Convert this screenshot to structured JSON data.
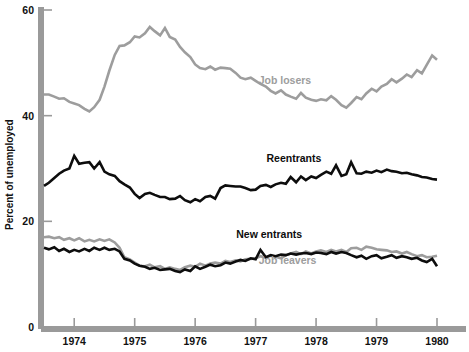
{
  "chart_data": {
    "type": "line",
    "title": "",
    "xlabel": "",
    "ylabel": "Percent of unemployed",
    "ylim": [
      0,
      60
    ],
    "xlim": [
      1973.5,
      1980.0
    ],
    "grid": false,
    "legend_position": "inline-annotations",
    "y_ticks": [
      0,
      20,
      40,
      60
    ],
    "y_tick_labels": [
      "0",
      "20",
      "40",
      "60"
    ],
    "x_ticks": [
      1974,
      1975,
      1976,
      1977,
      1978,
      1979,
      1980
    ],
    "x_tick_labels": [
      "1974",
      "1975",
      "1976",
      "1977",
      "1978",
      "1979",
      "1980"
    ],
    "colors": {
      "dark": "#0d0d0d",
      "gray": "#9d9d9d",
      "axis": "#9a9a9a"
    },
    "series": [
      {
        "name": "Job losers",
        "color": "#9d9d9d",
        "label_x": 1977.05,
        "label_y": 46.0,
        "x": [
          1973.5,
          1973.58,
          1973.67,
          1973.75,
          1973.83,
          1973.92,
          1974.0,
          1974.08,
          1974.17,
          1974.25,
          1974.33,
          1974.42,
          1974.5,
          1974.58,
          1974.67,
          1974.75,
          1974.83,
          1974.92,
          1975.0,
          1975.08,
          1975.17,
          1975.25,
          1975.33,
          1975.42,
          1975.5,
          1975.58,
          1975.67,
          1975.75,
          1975.83,
          1975.92,
          1976.0,
          1976.08,
          1976.17,
          1976.25,
          1976.33,
          1976.42,
          1976.5,
          1976.58,
          1976.67,
          1976.75,
          1976.83,
          1976.92,
          1977.0,
          1977.08,
          1977.17,
          1977.25,
          1977.33,
          1977.42,
          1977.5,
          1977.58,
          1977.67,
          1977.75,
          1977.83,
          1977.92,
          1978.0,
          1978.08,
          1978.17,
          1978.25,
          1978.33,
          1978.42,
          1978.5,
          1978.58,
          1978.67,
          1978.75,
          1978.83,
          1978.92,
          1979.0,
          1979.08,
          1979.17,
          1979.25,
          1979.33,
          1979.42,
          1979.5,
          1979.58,
          1979.67,
          1979.75,
          1979.83,
          1979.92,
          1980.0
        ],
        "values": [
          44.0,
          44.0,
          43.6,
          43.2,
          43.3,
          42.6,
          42.3,
          42.0,
          41.3,
          40.8,
          41.6,
          43.0,
          45.5,
          48.5,
          51.5,
          53.2,
          53.3,
          53.9,
          55.0,
          54.8,
          55.6,
          56.8,
          56.0,
          55.2,
          56.6,
          54.9,
          54.4,
          53.0,
          52.0,
          51.1,
          49.7,
          49.0,
          48.8,
          49.3,
          48.7,
          49.1,
          49.0,
          48.9,
          48.1,
          47.2,
          46.9,
          47.2,
          46.6,
          46.0,
          45.5,
          44.7,
          44.2,
          44.8,
          44.0,
          43.6,
          43.2,
          44.3,
          43.4,
          43.0,
          42.8,
          43.1,
          42.9,
          43.7,
          43.0,
          42.0,
          41.5,
          42.4,
          43.5,
          43.1,
          44.2,
          45.1,
          44.6,
          45.5,
          46.0,
          46.9,
          46.3,
          47.0,
          47.8,
          47.3,
          48.6,
          48.0,
          49.6,
          51.4,
          50.6
        ]
      },
      {
        "name": "Reentrants",
        "color": "#0d0d0d",
        "label_x": 1977.18,
        "label_y": 31.3,
        "x": [
          1973.5,
          1973.58,
          1973.67,
          1973.75,
          1973.83,
          1973.92,
          1974.0,
          1974.08,
          1974.17,
          1974.25,
          1974.33,
          1974.42,
          1974.5,
          1974.58,
          1974.67,
          1974.75,
          1974.83,
          1974.92,
          1975.0,
          1975.08,
          1975.17,
          1975.25,
          1975.33,
          1975.42,
          1975.5,
          1975.58,
          1975.67,
          1975.75,
          1975.83,
          1975.92,
          1976.0,
          1976.08,
          1976.17,
          1976.25,
          1976.33,
          1976.42,
          1976.5,
          1976.58,
          1976.67,
          1976.75,
          1976.83,
          1976.92,
          1977.0,
          1977.08,
          1977.17,
          1977.25,
          1977.33,
          1977.42,
          1977.5,
          1977.58,
          1977.67,
          1977.75,
          1977.83,
          1977.92,
          1978.0,
          1978.08,
          1978.17,
          1978.25,
          1978.33,
          1978.42,
          1978.5,
          1978.58,
          1978.67,
          1978.75,
          1978.83,
          1978.92,
          1979.0,
          1979.08,
          1979.17,
          1979.25,
          1979.33,
          1979.42,
          1979.5,
          1979.58,
          1979.67,
          1979.75,
          1979.83,
          1979.92,
          1980.0
        ],
        "values": [
          26.7,
          27.3,
          28.2,
          29.0,
          29.6,
          30.0,
          32.4,
          30.9,
          31.1,
          31.2,
          30.0,
          31.2,
          29.4,
          28.9,
          28.6,
          27.6,
          27.0,
          26.4,
          25.2,
          24.4,
          25.2,
          25.4,
          25.0,
          24.6,
          24.6,
          24.2,
          24.3,
          24.8,
          24.0,
          23.6,
          24.2,
          23.8,
          24.6,
          24.8,
          24.3,
          26.3,
          26.8,
          26.7,
          26.6,
          26.6,
          26.3,
          25.9,
          26.0,
          26.7,
          26.9,
          26.5,
          27.0,
          27.3,
          27.1,
          28.4,
          27.4,
          28.5,
          27.8,
          28.5,
          28.2,
          28.8,
          29.4,
          29.0,
          30.6,
          28.6,
          28.9,
          31.2,
          29.1,
          29.0,
          29.4,
          29.2,
          29.6,
          29.3,
          29.8,
          29.5,
          29.4,
          29.1,
          29.2,
          28.9,
          28.7,
          28.4,
          28.3,
          28.0,
          27.9
        ]
      },
      {
        "name": "Job leavers",
        "color": "#9d9d9d",
        "label_x": 1977.05,
        "label_y": 11.9,
        "x": [
          1973.5,
          1973.58,
          1973.67,
          1973.75,
          1973.83,
          1973.92,
          1974.0,
          1974.08,
          1974.17,
          1974.25,
          1974.33,
          1974.42,
          1974.5,
          1974.58,
          1974.67,
          1974.75,
          1974.83,
          1974.92,
          1975.0,
          1975.08,
          1975.17,
          1975.25,
          1975.33,
          1975.42,
          1975.5,
          1975.58,
          1975.67,
          1975.75,
          1975.83,
          1975.92,
          1976.0,
          1976.08,
          1976.17,
          1976.25,
          1976.33,
          1976.42,
          1976.5,
          1976.58,
          1976.67,
          1976.75,
          1976.83,
          1976.92,
          1977.0,
          1977.08,
          1977.17,
          1977.25,
          1977.33,
          1977.42,
          1977.5,
          1977.58,
          1977.67,
          1977.75,
          1977.83,
          1977.92,
          1978.0,
          1978.08,
          1978.17,
          1978.25,
          1978.33,
          1978.42,
          1978.5,
          1978.58,
          1978.67,
          1978.75,
          1978.83,
          1978.92,
          1979.0,
          1979.08,
          1979.17,
          1979.25,
          1979.33,
          1979.42,
          1979.5,
          1979.58,
          1979.67,
          1979.75,
          1979.83,
          1979.92,
          1980.0
        ],
        "values": [
          17.0,
          17.1,
          16.8,
          17.0,
          16.5,
          16.8,
          16.4,
          16.8,
          16.2,
          16.5,
          16.2,
          16.6,
          16.3,
          16.6,
          16.0,
          15.0,
          13.2,
          12.8,
          12.2,
          11.6,
          11.5,
          11.8,
          11.3,
          11.5,
          11.0,
          11.3,
          11.0,
          10.8,
          11.3,
          11.6,
          11.4,
          12.0,
          11.6,
          12.0,
          12.2,
          12.0,
          12.5,
          12.3,
          12.6,
          12.4,
          12.8,
          12.9,
          13.0,
          13.4,
          13.1,
          13.5,
          13.3,
          13.0,
          13.6,
          13.9,
          14.2,
          13.8,
          14.3,
          13.9,
          14.3,
          14.5,
          14.2,
          14.6,
          14.3,
          14.6,
          14.2,
          14.9,
          15.0,
          14.6,
          15.2,
          15.0,
          14.7,
          14.6,
          14.5,
          14.2,
          14.3,
          13.9,
          14.2,
          13.8,
          13.4,
          13.6,
          13.2,
          13.3,
          13.5
        ]
      },
      {
        "name": "New entrants",
        "color": "#0d0d0d",
        "label_x": 1976.68,
        "label_y": 16.9,
        "x": [
          1973.5,
          1973.58,
          1973.67,
          1973.75,
          1973.83,
          1973.92,
          1974.0,
          1974.08,
          1974.17,
          1974.25,
          1974.33,
          1974.42,
          1974.5,
          1974.58,
          1974.67,
          1974.75,
          1974.83,
          1974.92,
          1975.0,
          1975.08,
          1975.17,
          1975.25,
          1975.33,
          1975.42,
          1975.5,
          1975.58,
          1975.67,
          1975.75,
          1975.83,
          1975.92,
          1976.0,
          1976.08,
          1976.17,
          1976.25,
          1976.33,
          1976.42,
          1976.5,
          1976.58,
          1976.67,
          1976.75,
          1976.83,
          1976.92,
          1977.0,
          1977.08,
          1977.17,
          1977.25,
          1977.33,
          1977.42,
          1977.5,
          1977.58,
          1977.67,
          1977.75,
          1977.83,
          1977.92,
          1978.0,
          1978.08,
          1978.17,
          1978.25,
          1978.33,
          1978.42,
          1978.5,
          1978.58,
          1978.67,
          1978.75,
          1978.83,
          1978.92,
          1979.0,
          1979.08,
          1979.17,
          1979.25,
          1979.33,
          1979.42,
          1979.5,
          1979.58,
          1979.67,
          1979.75,
          1979.83,
          1979.92,
          1980.0
        ],
        "values": [
          15.0,
          14.7,
          15.1,
          14.4,
          14.8,
          14.2,
          14.6,
          14.3,
          14.8,
          14.4,
          15.0,
          14.6,
          15.0,
          14.6,
          14.8,
          14.3,
          12.9,
          12.6,
          12.0,
          11.6,
          11.4,
          11.0,
          11.2,
          10.8,
          10.9,
          11.0,
          10.6,
          10.4,
          10.9,
          10.6,
          11.5,
          11.0,
          11.4,
          11.8,
          11.5,
          11.7,
          12.2,
          12.0,
          12.4,
          12.7,
          12.5,
          13.0,
          12.8,
          14.6,
          13.2,
          13.6,
          13.4,
          13.7,
          13.6,
          13.9,
          13.7,
          13.9,
          14.0,
          13.8,
          14.1,
          14.0,
          13.8,
          14.2,
          13.9,
          14.2,
          14.0,
          13.6,
          13.2,
          13.5,
          12.9,
          13.4,
          13.6,
          13.0,
          13.3,
          13.6,
          13.1,
          13.4,
          13.2,
          12.9,
          13.1,
          12.6,
          12.3,
          12.9,
          11.5
        ]
      }
    ]
  },
  "axis": {
    "y_title": "Percent of unemployed"
  }
}
